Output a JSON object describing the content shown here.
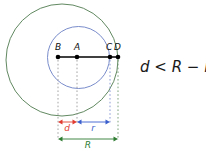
{
  "figure": {
    "points": [
      {
        "id": "B",
        "label": "B",
        "x": 58,
        "y": 57
      },
      {
        "id": "A",
        "label": "A",
        "x": 77,
        "y": 57
      },
      {
        "id": "C",
        "label": "C",
        "x": 110,
        "y": 57
      },
      {
        "id": "D",
        "label": "D",
        "x": 118,
        "y": 57
      }
    ],
    "circles": [
      {
        "id": "big",
        "name": "large-circle-R",
        "cx": 62,
        "cy": 60,
        "r": 56,
        "color": "#4f7a4f"
      },
      {
        "id": "small",
        "name": "small-circle-r",
        "cx": 78.5,
        "cy": 57.5,
        "r": 31,
        "color": "#6a7fc4"
      }
    ],
    "segment": {
      "name": "diameter-segment-BD",
      "x1": 58,
      "x2": 118,
      "y": 57,
      "color": "#000000"
    },
    "measures": [
      {
        "id": "d",
        "label": "d",
        "x1": 58,
        "x2": 77,
        "y": 122,
        "color": "#e03c31",
        "label_x": 67,
        "label_y": 131
      },
      {
        "id": "r",
        "label": "r",
        "x1": 77,
        "x2": 110,
        "y": 122,
        "color": "#3a5fcd",
        "label_x": 93,
        "label_y": 131
      },
      {
        "id": "R",
        "label": "R",
        "x1": 58,
        "x2": 118,
        "y": 139,
        "color": "#2e7d32",
        "label_x": 88,
        "label_y": 148
      }
    ],
    "guides": [
      {
        "from": "B",
        "x": 58,
        "y1": 60,
        "y2": 140,
        "color": "#9a9a9a"
      },
      {
        "from": "A",
        "x": 77,
        "y1": 60,
        "y2": 124,
        "color": "#9a9a9a"
      },
      {
        "from": "C",
        "x": 110,
        "y1": 60,
        "y2": 124,
        "color": "#7d8fd0"
      },
      {
        "from": "D",
        "x": 118,
        "y1": 60,
        "y2": 140,
        "color": "#6f9a6f"
      }
    ],
    "equation": {
      "text": "d < R − r",
      "x": 140,
      "y": 72
    }
  }
}
